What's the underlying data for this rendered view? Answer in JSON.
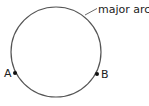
{
  "diagram": {
    "circle": {
      "cx": 56,
      "cy": 52,
      "r": 45,
      "stroke": "#555555"
    },
    "points": [
      {
        "label": "A",
        "x": 15,
        "y": 73
      },
      {
        "label": "B",
        "x": 97,
        "y": 74
      }
    ],
    "annotation": {
      "label": "major arc"
    }
  }
}
